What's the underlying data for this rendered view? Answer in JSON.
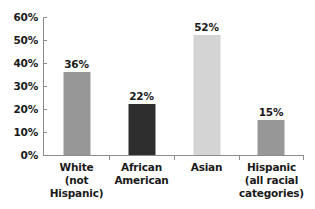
{
  "chart_data": {
    "type": "bar",
    "title": "",
    "subtitle": "",
    "xlabel": "",
    "ylabel": "",
    "categories": [
      "White (not Hispanic)",
      "African American",
      "Asian",
      "Hispanic (all racial categories)"
    ],
    "category_lines": [
      [
        "White",
        "(not Hispanic)"
      ],
      [
        "African",
        "American"
      ],
      [
        "Asian"
      ],
      [
        "Hispanic",
        "(all racial",
        "categories)"
      ]
    ],
    "values": [
      36,
      22,
      52,
      15
    ],
    "value_labels": [
      "36%",
      "22%",
      "52%",
      "15%"
    ],
    "bar_colors": [
      "#979797",
      "#2e2e2e",
      "#d4d4d4",
      "#979797"
    ],
    "ylim": [
      0,
      60
    ],
    "ytick_values": [
      60,
      50,
      40,
      30,
      20,
      10,
      0
    ],
    "ytick_labels": [
      "60%",
      "50%",
      "40%",
      "30%",
      "20%",
      "10%",
      "0%"
    ],
    "grid": false,
    "legend": null,
    "axis_color": "#8c8c8c",
    "text_color": "#1a1a1a",
    "background_color": "#ffffff"
  }
}
